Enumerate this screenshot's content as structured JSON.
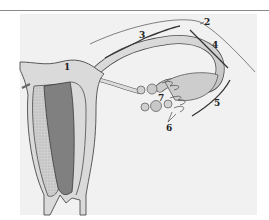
{
  "figure": {
    "type": "anatomical-diagram",
    "colors": {
      "background": "#ffffff",
      "panel": "#f1f1f1",
      "tissue": "#d9d9d9",
      "tissue_dark": "#bcbcbc",
      "outline": "#4a4a4a",
      "leader": "#333333"
    },
    "labels": [
      {
        "id": "1",
        "text": "1",
        "x": 64,
        "y": 63
      },
      {
        "id": "2",
        "text": "2",
        "x": 204,
        "y": 18
      },
      {
        "id": "3",
        "text": "3",
        "x": 139,
        "y": 31
      },
      {
        "id": "4",
        "text": "4",
        "x": 212,
        "y": 41
      },
      {
        "id": "5",
        "text": "5",
        "x": 214,
        "y": 99
      },
      {
        "id": "6",
        "text": "6",
        "x": 166,
        "y": 124
      },
      {
        "id": "7",
        "text": "7",
        "x": 158,
        "y": 94
      }
    ]
  }
}
